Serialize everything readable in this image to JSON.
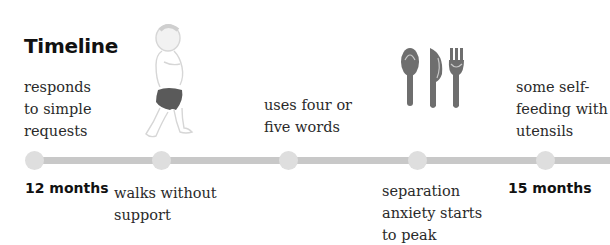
{
  "title": "Timeline",
  "events": {
    "responds": "responds to simple requests",
    "walks": "walks without support",
    "words": "uses four or five words",
    "separation": "separation anxiety starts to peak",
    "feeding": "some self-feeding with utensils"
  },
  "events_lines": {
    "responds": [
      "responds",
      "to simple",
      "requests"
    ],
    "walks": [
      "walks without",
      "support"
    ],
    "words": [
      "uses four or",
      "five words"
    ],
    "separation": [
      "separation",
      "anxiety starts",
      "to peak"
    ],
    "feeding": [
      "some self-",
      "feeding with",
      "utensils"
    ]
  },
  "months": {
    "start": "12 months",
    "end": "15 months"
  },
  "icons": {
    "baby": "walking-toddler-icon",
    "utensils": "spoon-knife-fork-icon"
  },
  "colors": {
    "line": "#c8c8c8",
    "dot": "#dedede",
    "utensil": "#6e6e6e"
  }
}
